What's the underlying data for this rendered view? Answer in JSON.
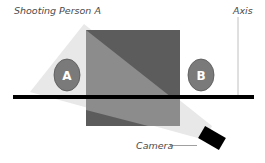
{
  "diagram": {
    "labels": {
      "shooting": "Shooting Person A",
      "axis": "Axis",
      "camera": "Camera"
    },
    "subjects": [
      {
        "id": "A",
        "label": "A"
      },
      {
        "id": "B",
        "label": "B"
      }
    ],
    "colors": {
      "background": "#ffffff",
      "axis_line": "#000000",
      "square_dark": "#5a5a5a",
      "square_light": "#8a8a8a",
      "beam": "#e6e6e6",
      "oval_fill": "#7a7a7a",
      "oval_stroke": "#555555",
      "camera": "#000000",
      "thin_line": "#aaaaaa",
      "label_text": "#4a4a4a"
    }
  }
}
